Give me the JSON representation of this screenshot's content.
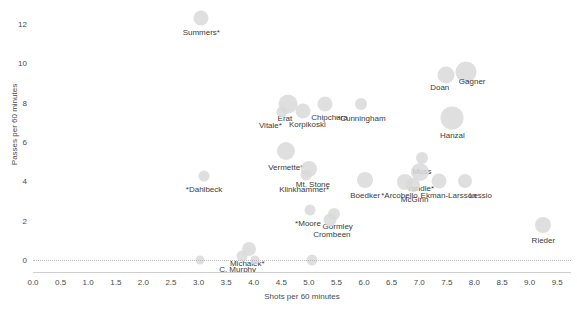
{
  "chart_data": {
    "type": "scatter",
    "title": "",
    "xlabel": "Shots per 60 minutes",
    "ylabel": "Passes per 60 minutes",
    "xlim": [
      0.0,
      9.75
    ],
    "ylim": [
      -0.6,
      12.9
    ],
    "xticks": [
      "0.0",
      "0.5",
      "1.0",
      "1.5",
      "2.0",
      "2.5",
      "3.0",
      "3.5",
      "4.0",
      "4.5",
      "5.0",
      "5.5",
      "6.0",
      "6.5",
      "7.0",
      "7.5",
      "8.0",
      "8.5",
      "9.0",
      "9.5"
    ],
    "xtick_values": [
      0.0,
      0.5,
      1.0,
      1.5,
      2.0,
      2.5,
      3.0,
      3.5,
      4.0,
      4.5,
      5.0,
      5.5,
      6.0,
      6.5,
      7.0,
      7.5,
      8.0,
      8.5,
      9.0,
      9.5
    ],
    "yticks": [
      "0",
      "2",
      "4",
      "6",
      "8",
      "10",
      "12"
    ],
    "ytick_values": [
      0,
      2,
      4,
      6,
      8,
      10,
      12
    ],
    "grid": false,
    "legend": "none",
    "bubble_color": "#d9d9d9",
    "label_color": "#3b3b3b",
    "points": [
      {
        "label": "Summers*",
        "x": 3.05,
        "y": 12.3,
        "size": 15,
        "label_dx": 0,
        "label_dy": 10
      },
      {
        "label": "Doan",
        "x": 7.48,
        "y": 9.42,
        "size": 17,
        "label_dx": -6,
        "label_dy": 8
      },
      {
        "label": "Gagner",
        "x": 7.85,
        "y": 9.55,
        "size": 21,
        "label_dx": 6,
        "label_dy": 5
      },
      {
        "label": "Hanzal",
        "x": 7.6,
        "y": 7.22,
        "size": 23,
        "label_dx": 0,
        "label_dy": 13
      },
      {
        "label": "Erat",
        "x": 4.62,
        "y": 7.95,
        "size": 19,
        "label_dx": -3,
        "label_dy": 10
      },
      {
        "label": "Korpikoski",
        "x": 4.9,
        "y": 7.55,
        "size": 15,
        "label_dx": 4,
        "label_dy": 9
      },
      {
        "label": "Chipchura",
        "x": 5.3,
        "y": 7.95,
        "size": 15,
        "label_dx": 4,
        "label_dy": 9
      },
      {
        "label": "Vitale*",
        "x": 4.52,
        "y": 7.52,
        "size": 11,
        "label_dx": -12,
        "label_dy": 9
      },
      {
        "label": "*Cunningham",
        "x": 5.95,
        "y": 7.95,
        "size": 12,
        "label_dx": 0,
        "label_dy": 10
      },
      {
        "label": "Vermette*",
        "x": 4.58,
        "y": 5.55,
        "size": 18,
        "label_dx": 0,
        "label_dy": 12
      },
      {
        "label": "Mt. Stone",
        "x": 5.0,
        "y": 4.65,
        "size": 16,
        "label_dx": 4,
        "label_dy": 11
      },
      {
        "label": "Klinkhammer*",
        "x": 4.95,
        "y": 4.3,
        "size": 11,
        "label_dx": -2,
        "label_dy": 10
      },
      {
        "label": "*Dahlbeck",
        "x": 3.1,
        "y": 4.25,
        "size": 11,
        "label_dx": 0,
        "label_dy": 9
      },
      {
        "label": "Boedker",
        "x": 6.02,
        "y": 4.05,
        "size": 16,
        "label_dx": 0,
        "label_dy": 11
      },
      {
        "label": "Moss",
        "x": 7.05,
        "y": 5.2,
        "size": 12,
        "label_dx": 0,
        "label_dy": 9
      },
      {
        "label": "Yandle*",
        "x": 7.02,
        "y": 4.5,
        "size": 18,
        "label_dx": 0,
        "label_dy": 12
      },
      {
        "label": "*Arcobello",
        "x": 6.75,
        "y": 3.95,
        "size": 16,
        "label_dx": -6,
        "label_dy": 9
      },
      {
        "label": "McGinn",
        "x": 6.88,
        "y": 3.82,
        "size": 14,
        "label_dx": 2,
        "label_dy": 10
      },
      {
        "label": "Ekman-Larsson",
        "x": 7.35,
        "y": 4.02,
        "size": 15,
        "label_dx": 10,
        "label_dy": 10
      },
      {
        "label": "Lessio",
        "x": 7.82,
        "y": 4.02,
        "size": 14,
        "label_dx": 16,
        "label_dy": 10
      },
      {
        "label": "*Moore",
        "x": 5.02,
        "y": 2.55,
        "size": 11,
        "label_dx": -2,
        "label_dy": 9
      },
      {
        "label": "Gormley",
        "x": 5.45,
        "y": 2.35,
        "size": 12,
        "label_dx": 4,
        "label_dy": 8
      },
      {
        "label": "Crombeen",
        "x": 5.38,
        "y": 2.05,
        "size": 13,
        "label_dx": 2,
        "label_dy": 10
      },
      {
        "label": "Rieder",
        "x": 9.25,
        "y": 1.78,
        "size": 16,
        "label_dx": 0,
        "label_dy": 11
      },
      {
        "label": "Michalek*",
        "x": 3.92,
        "y": 0.58,
        "size": 14,
        "label_dx": -2,
        "label_dy": 10
      },
      {
        "label": "C. Murphy",
        "x": 3.78,
        "y": 0.2,
        "size": 11,
        "label_dx": -4,
        "label_dy": 9
      },
      {
        "label": "A. Campbell",
        "x": 3.02,
        "y": 0.0,
        "size": 9,
        "label_dx": 0,
        "label_dy": 10
      },
      {
        "label": "Schlemko*",
        "x": 4.02,
        "y": 0.0,
        "size": 9,
        "label_dx": 0,
        "label_dy": 10
      },
      {
        "label": "McMillan*",
        "x": 5.05,
        "y": 0.0,
        "size": 11,
        "label_dx": 0,
        "label_dy": 10
      }
    ]
  }
}
